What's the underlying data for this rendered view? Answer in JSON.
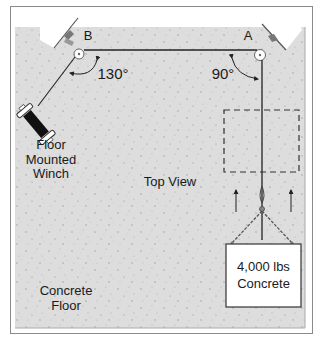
{
  "diagram": {
    "view_label": "Top View",
    "floor_label": "Concrete\nFloor",
    "winch_label": "Floor\nMounted\nWinch",
    "anchor_a": {
      "label": "A",
      "angle": "90°"
    },
    "anchor_b": {
      "label": "B",
      "angle": "130°"
    },
    "load": {
      "weight": "4,000 lbs",
      "material": "Concrete"
    },
    "colors": {
      "frame": "#8a8a8a",
      "floor": "#dcdcdc",
      "rope": "#222222",
      "winch_drum": "#111111",
      "wall_block": "#ffffff",
      "load_box_border": "#333333"
    }
  }
}
